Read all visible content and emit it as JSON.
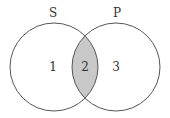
{
  "diagram": {
    "type": "venn",
    "sets": [
      {
        "name": "S",
        "region_label": "1"
      },
      {
        "name": "P",
        "region_label": "3"
      }
    ],
    "intersection_label": "2",
    "colors": {
      "stroke": "#555555",
      "intersection_fill": "#c8c8c8",
      "background": "#ffffff",
      "text": "#333333"
    }
  }
}
